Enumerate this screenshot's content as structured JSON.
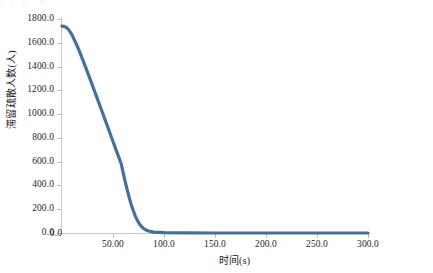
{
  "chart_data": {
    "type": "line",
    "title": "",
    "xlabel": "时间(s)",
    "ylabel": "滞留疏散人数(人)",
    "xlim": [
      0,
      300
    ],
    "ylim": [
      0,
      1800
    ],
    "grid": false,
    "legend": "none",
    "line_color": "#44709E",
    "x_ticks": [
      "0.0",
      "50.00",
      "100.0",
      "150.0",
      "200.0",
      "250.0",
      "300.0"
    ],
    "x_tick_values": [
      0,
      50,
      100,
      150,
      200,
      250,
      300
    ],
    "y_ticks": [
      "0.0",
      "200.0",
      "400.0",
      "600.0",
      "800.0",
      "1000.0",
      "1200.0",
      "1400.0",
      "1600.0",
      "1800.0"
    ],
    "y_tick_values": [
      0,
      200,
      400,
      600,
      800,
      1000,
      1200,
      1400,
      1600,
      1800
    ],
    "series": [
      {
        "name": "滞留疏散人数",
        "x": [
          0,
          2,
          4,
          6,
          8,
          10,
          14,
          18,
          22,
          26,
          30,
          34,
          38,
          42,
          46,
          50,
          54,
          58,
          62,
          64,
          66,
          68,
          70,
          72,
          74,
          76,
          78,
          80,
          82,
          84,
          86,
          90,
          100,
          120,
          150,
          180,
          210,
          240,
          270,
          300
        ],
        "y": [
          1740,
          1738,
          1730,
          1715,
          1692,
          1663,
          1590,
          1508,
          1420,
          1330,
          1238,
          1145,
          1052,
          958,
          864,
          770,
          676,
          583,
          430,
          360,
          295,
          236,
          184,
          140,
          104,
          76,
          54,
          38,
          27,
          19,
          14,
          8,
          3,
          1,
          0,
          0,
          0,
          0,
          0,
          0
        ]
      }
    ]
  },
  "axis": {
    "x_title": "时间(s)",
    "y_title": "滞留疏散人数(人)"
  }
}
